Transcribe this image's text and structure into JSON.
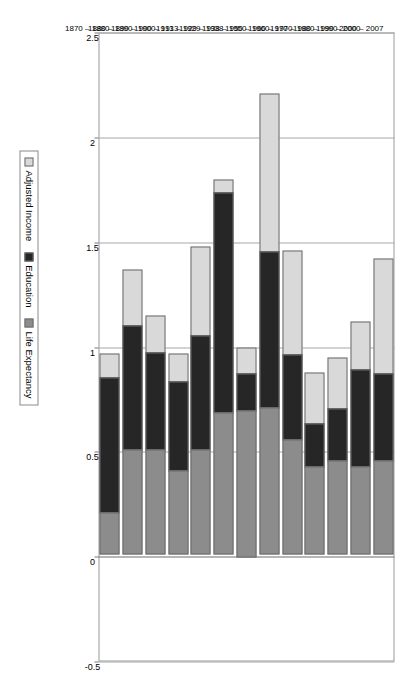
{
  "chart_data": {
    "type": "bar",
    "orientation": "horizontal-stacked",
    "title": "",
    "subtitle": "",
    "xlabel": "",
    "ylabel": "",
    "xlim": [
      -0.5,
      2.5
    ],
    "xticks": [
      "2.5",
      "2",
      "1.5",
      "1",
      "0.5",
      "0",
      "-0.5"
    ],
    "xtick_values": [
      2.5,
      2,
      1.5,
      1,
      0.5,
      0,
      -0.5
    ],
    "grid": true,
    "legend_position": "bottom",
    "categories": [
      "1870 – 1880",
      "1880 – 1890",
      "1890 – 1900",
      "1900 – 1913",
      "1913 – 1929",
      "1929 – 1938",
      "1938 – 1950",
      "1950 – 1960",
      "1960 – 1970",
      "1970 – 1980",
      "1980 – 1990",
      "1990 – 2000",
      "2000 – 2007"
    ],
    "series": [
      {
        "name": "Life Expectancy",
        "color": "#8c8c8c",
        "values": [
          0.2,
          0.5,
          0.5,
          0.4,
          0.5,
          0.68,
          0.93,
          0.7,
          0.55,
          0.42,
          0.45,
          0.42,
          0.45
        ]
      },
      {
        "name": "Education",
        "color": "#262626",
        "values": [
          0.65,
          0.6,
          0.47,
          0.43,
          0.55,
          1.05,
          0.24,
          0.75,
          0.41,
          0.21,
          0.25,
          0.47,
          0.42
        ]
      },
      {
        "name": "Adjusted Income",
        "color": "#d9d9d9",
        "values": [
          0.12,
          0.27,
          0.18,
          0.14,
          0.43,
          0.07,
          -0.17,
          0.76,
          0.5,
          0.25,
          0.25,
          0.23,
          0.55
        ]
      }
    ]
  },
  "legend": {
    "items": [
      {
        "label": "Adjusted Income",
        "color": "#d9d9d9"
      },
      {
        "label": "Education",
        "color": "#262626"
      },
      {
        "label": "Life Expectancy",
        "color": "#8c8c8c"
      }
    ]
  },
  "axis": {
    "value_ticks": [
      "2.5",
      "2",
      "1.5",
      "1",
      "0.5",
      "0",
      "-0.5"
    ]
  }
}
